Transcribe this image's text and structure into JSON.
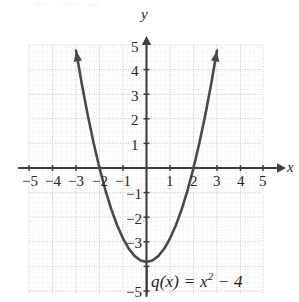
{
  "chart_data": {
    "type": "line",
    "title": "",
    "subtitle": "",
    "xlabel": "x",
    "ylabel": "y",
    "xlim": [
      -5.5,
      5.5
    ],
    "ylim": [
      -5.5,
      5.5
    ],
    "grid": true,
    "legend": "none",
    "annotations": [
      {
        "name": "function-equation",
        "text": "q(x) = x² − 4",
        "parts": {
          "lhs": "q(x)",
          "equals": "=",
          "base": "x",
          "exponent": "2",
          "operator": "−",
          "constant": "4"
        }
      }
    ],
    "series": [
      {
        "name": "q(x) = x² − 4",
        "expression": "x^2 - 4",
        "vertex": [
          0,
          -4
        ],
        "x_intercepts": [
          -2,
          2
        ],
        "y_intercept": -4,
        "arrow_endpoints": [
          [
            -3,
            5
          ],
          [
            3,
            5
          ]
        ],
        "color": "#4a4a4a",
        "x": [
          -3,
          -2.75,
          -2.5,
          -2.25,
          -2,
          -1.75,
          -1.5,
          -1.25,
          -1,
          -0.75,
          -0.5,
          -0.25,
          0,
          0.25,
          0.5,
          0.75,
          1,
          1.25,
          1.5,
          1.75,
          2,
          2.25,
          2.5,
          2.75,
          3
        ],
        "values": [
          5,
          3.5625,
          2.25,
          1.0625,
          0,
          -0.9375,
          -1.75,
          -2.4375,
          -3,
          -3.4375,
          -3.75,
          -3.9375,
          -4,
          -3.9375,
          -3.75,
          -3.4375,
          -3,
          -2.4375,
          -1.75,
          -0.9375,
          0,
          1.0625,
          2.25,
          3.5625,
          5
        ]
      }
    ],
    "x_ticks": [
      {
        "value": -5,
        "label": "−5"
      },
      {
        "value": -4,
        "label": "−4"
      },
      {
        "value": -3,
        "label": "−3"
      },
      {
        "value": -2,
        "label": "−2"
      },
      {
        "value": -1,
        "label": "−1"
      },
      {
        "value": 1,
        "label": "1"
      },
      {
        "value": 2,
        "label": "2"
      },
      {
        "value": 3,
        "label": "3"
      },
      {
        "value": 4,
        "label": "4"
      },
      {
        "value": 5,
        "label": "5"
      }
    ],
    "y_ticks": [
      {
        "value": 5,
        "label": "5"
      },
      {
        "value": 4,
        "label": "4"
      },
      {
        "value": 3,
        "label": "3"
      },
      {
        "value": 2,
        "label": "2"
      },
      {
        "value": 1,
        "label": "1"
      },
      {
        "value": -1,
        "label": "−1"
      },
      {
        "value": -2,
        "label": "−2"
      },
      {
        "value": -3,
        "label": "−3"
      },
      {
        "value": -5,
        "label": "−5"
      }
    ]
  },
  "axes": {
    "x_axis_name": "x",
    "y_axis_name": "y"
  },
  "colors": {
    "curve": "#4a4a4a",
    "axis": "#3d3d3d",
    "grid": "#cfcfcf",
    "text": "#262626",
    "background": "#ffffff"
  }
}
